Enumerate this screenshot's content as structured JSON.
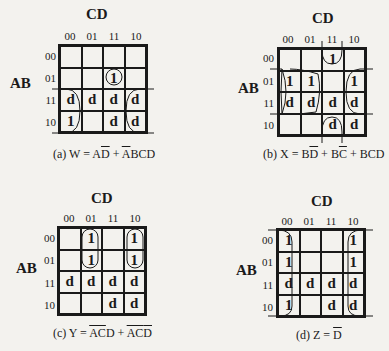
{
  "col_var": "CD",
  "row_var": "AB",
  "col_labels": [
    "00",
    "01",
    "11",
    "10"
  ],
  "row_labels": [
    "00",
    "01",
    "11",
    "10"
  ],
  "maps": [
    {
      "id": "a",
      "cells": [
        [
          "",
          "",
          "",
          ""
        ],
        [
          "",
          "",
          "1",
          ""
        ],
        [
          "d",
          "d",
          "d",
          "d"
        ],
        [
          "1",
          "",
          "d",
          "d"
        ]
      ],
      "caption": {
        "prefix": "(a) W = A",
        "t1": "D",
        "mid": " + ",
        "t2": "A",
        "rest": "BCD"
      }
    },
    {
      "id": "b",
      "cells": [
        [
          "",
          "",
          "1",
          ""
        ],
        [
          "1",
          "1",
          "",
          "1"
        ],
        [
          "d",
          "d",
          "d",
          "d"
        ],
        [
          "",
          "",
          "d",
          "d"
        ]
      ],
      "caption": {
        "prefix": "(b) X = B",
        "t1": "D",
        "mid": " + B",
        "t2": "C",
        "rest": " + BCD"
      }
    },
    {
      "id": "c",
      "cells": [
        [
          "",
          "1",
          "",
          "1"
        ],
        [
          "",
          "1",
          "",
          "1"
        ],
        [
          "d",
          "d",
          "d",
          "d"
        ],
        [
          "",
          "",
          "d",
          "d"
        ]
      ],
      "caption": {
        "prefix": "(c) Y = ",
        "t1": "AC",
        "mid": "D + ",
        "t2": "AC",
        "t3": "D"
      }
    },
    {
      "id": "d",
      "cells": [
        [
          "1",
          "",
          "",
          "1"
        ],
        [
          "1",
          "",
          "",
          "1"
        ],
        [
          "d",
          "d",
          "d",
          "d"
        ],
        [
          "1",
          "",
          "d",
          "d"
        ]
      ],
      "caption": {
        "prefix": "(d) Z = ",
        "t1": "D"
      }
    }
  ]
}
